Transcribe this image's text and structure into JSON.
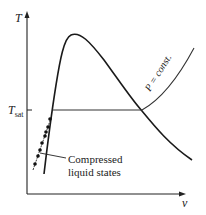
{
  "diagram": {
    "y_axis_label": "T",
    "x_axis_label": "v",
    "tsat_label": "T",
    "tsat_sub": "sat",
    "isobar_label": "P = const.",
    "annotation_line1": "Compressed",
    "annotation_line2": "liquid states",
    "colors": {
      "line": "#1a1a1a",
      "axis": "#222222"
    }
  }
}
